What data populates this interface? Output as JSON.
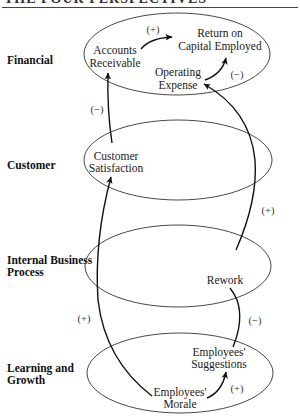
{
  "header": {
    "title": "THE FOUR PERSPECTIVES"
  },
  "perspectives": [
    {
      "label_line1": "Financial",
      "label_line2": ""
    },
    {
      "label_line1": "Customer",
      "label_line2": ""
    },
    {
      "label_line1": "Internal Business",
      "label_line2": "Process"
    },
    {
      "label_line1": "Learning and",
      "label_line2": "Growth"
    }
  ],
  "nodes": {
    "accounts_receivable": {
      "line1": "Accounts",
      "line2": "Receivable"
    },
    "return_on_capital": {
      "line1": "Return on",
      "line2": "Capital Employed"
    },
    "operating_expense": {
      "line1": "Operating",
      "line2": "Expense"
    },
    "customer_satisfaction": {
      "line1": "Customer",
      "line2": "Satisfaction"
    },
    "rework": {
      "line1": "Rework"
    },
    "employees_suggestions": {
      "line1": "Employees'",
      "line2": "Suggestions"
    },
    "employees_morale": {
      "line1": "Employees'",
      "line2": "Morale"
    }
  },
  "links": [
    {
      "from": "Accounts Receivable",
      "to": "Return on Capital Employed",
      "sign": "(+)"
    },
    {
      "from": "Operating Expense",
      "to": "Return on Capital Employed",
      "sign": "(−)"
    },
    {
      "from": "Customer Satisfaction",
      "to": "Accounts Receivable",
      "sign": "(−)"
    },
    {
      "from": "Rework",
      "to": "Operating Expense",
      "sign": "(+)"
    },
    {
      "from": "Employees' Suggestions",
      "to": "Rework",
      "sign": "(−)"
    },
    {
      "from": "Employees' Morale",
      "to": "Customer Satisfaction",
      "sign": "(+)"
    },
    {
      "from": "Employees' Morale",
      "to": "Employees' Suggestions",
      "sign": "(+)"
    }
  ]
}
